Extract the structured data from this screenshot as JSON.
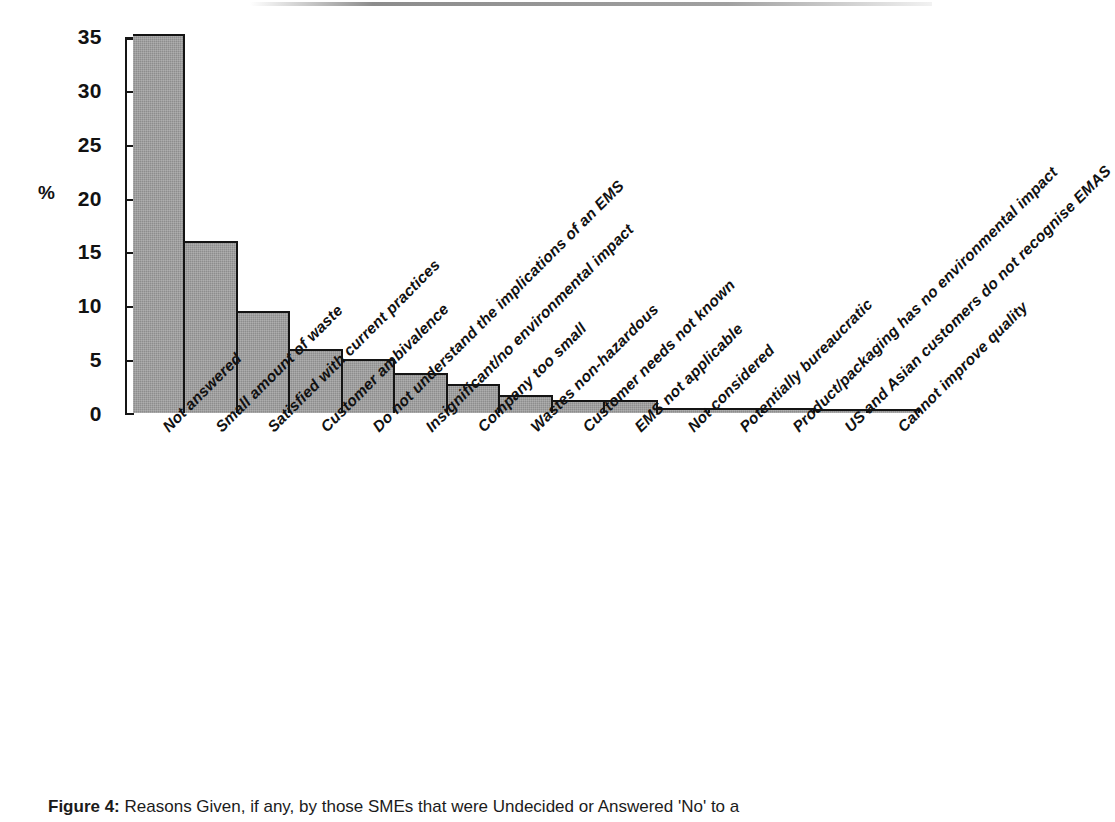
{
  "figure": {
    "caption_label": "Figure 4:",
    "caption_text": "Reasons Given, if any, by those SMEs that were Undecided or Answered 'No' to a"
  },
  "chart_data": {
    "type": "bar",
    "title": "",
    "subtitle": "",
    "xlabel": "",
    "ylabel": "%",
    "ylim": [
      0,
      35
    ],
    "yticks": [
      0,
      5,
      10,
      15,
      20,
      25,
      30,
      35
    ],
    "ytick_labels": [
      "0",
      "5",
      "10",
      "15",
      "20",
      "25",
      "30",
      "35"
    ],
    "grid": false,
    "legend": "none",
    "bar_color": "#8d8d8d",
    "bar_edge_color": "#141414",
    "axis_color": "#151515",
    "categories": [
      "Not answered",
      "Small amount of waste",
      "Satisfied with current practices",
      "Customer ambivalence",
      "Do not understand the implications of an EMS",
      "Insignificant/no environmental impact",
      "Company too small",
      "Wastes non-hazardous",
      "Customer needs not known",
      "EMS not applicable",
      "Not considered",
      "Potentially bureaucratic",
      "Product/packaging has no environmental impact",
      "US and Asian customers do not recognise EMAS",
      "Cannot improve quality"
    ],
    "values": [
      35.4,
      16.1,
      9.5,
      6.0,
      5.0,
      3.7,
      2.7,
      1.7,
      1.2,
      1.2,
      0.5,
      0.5,
      0.5,
      0.4,
      0.4
    ]
  }
}
